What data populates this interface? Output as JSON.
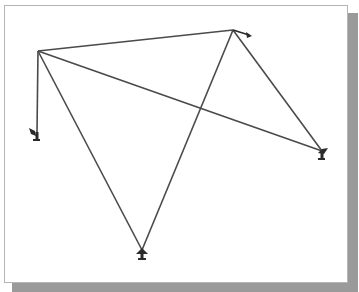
{
  "diagram": {
    "type": "truss-structure",
    "frame": {
      "background": "#ffffff",
      "border": "#b5b5b5",
      "shadow": "#9a9a9a"
    },
    "line_color": "#4a4a4a",
    "nodes": [
      {
        "id": "A",
        "x": 38,
        "y": 51
      },
      {
        "id": "B",
        "x": 233,
        "y": 30
      },
      {
        "id": "C",
        "x": 37,
        "y": 132,
        "support": "left"
      },
      {
        "id": "D",
        "x": 142,
        "y": 250,
        "support": "bottom"
      },
      {
        "id": "E",
        "x": 322,
        "y": 151,
        "support": "right"
      }
    ],
    "members": [
      {
        "from": "A",
        "to": "B"
      },
      {
        "from": "A",
        "to": "C"
      },
      {
        "from": "A",
        "to": "D"
      },
      {
        "from": "A",
        "to": "E"
      },
      {
        "from": "B",
        "to": "D"
      },
      {
        "from": "B",
        "to": "E"
      }
    ],
    "load": {
      "node": "B",
      "direction": "right-down",
      "to": {
        "x": 249,
        "y": 35
      }
    }
  }
}
